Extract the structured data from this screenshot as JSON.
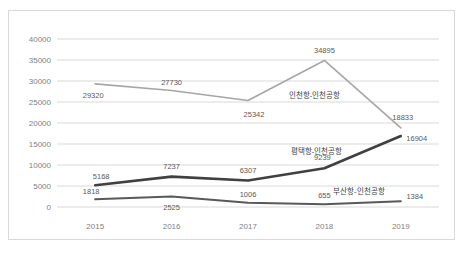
{
  "chart_data": {
    "type": "line",
    "title": "",
    "xlabel": "",
    "ylabel": "",
    "categories": [
      "2015",
      "2016",
      "2017",
      "2018",
      "2019"
    ],
    "ylim": [
      0,
      40000
    ],
    "yticks": [
      "0",
      "5000",
      "10000",
      "15000",
      "20000",
      "25000",
      "30000",
      "35000",
      "40000"
    ],
    "ytick_values": [
      0,
      5000,
      10000,
      15000,
      20000,
      25000,
      30000,
      35000,
      40000
    ],
    "grid": "horizontal",
    "legend_position": "inline-annotations",
    "series": [
      {
        "name": "인천항-인천공항",
        "color": "#a6a6a6",
        "values": [
          29320,
          27730,
          25342,
          34895,
          18833
        ],
        "labels": [
          "29320",
          "27730",
          "25342",
          "34895",
          "18833"
        ]
      },
      {
        "name": "평택항-인천공항",
        "color": "#404040",
        "values": [
          5168,
          7237,
          6307,
          9239,
          16904
        ],
        "labels": [
          "5168",
          "7237",
          "6307",
          "9239",
          "16904"
        ]
      },
      {
        "name": "부산항-인천공항",
        "color": "#595959",
        "values": [
          1818,
          2525,
          1006,
          655,
          1384
        ],
        "labels": [
          "1818",
          "2525",
          "1006",
          "655",
          "1384"
        ]
      }
    ]
  },
  "colors": {
    "border": "#d9d9d9",
    "gridline": "#d9d9d9",
    "axis_text": "#7f7f7f",
    "data_text": "#595959",
    "background": "#ffffff"
  }
}
